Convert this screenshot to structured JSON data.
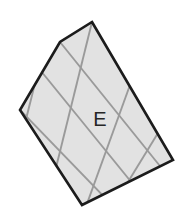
{
  "figure": {
    "name": "shaded-grid-polygon",
    "label": "E",
    "label_position": {
      "x": 100,
      "y": 121
    },
    "colors": {
      "background": "#ffffff",
      "fill": "#e2e2e2",
      "grid_line": "#9a9a9a",
      "outline": "#1c1c1c",
      "label_text": "#262626"
    },
    "outline_width": 2.6,
    "grid_line_width": 1.9,
    "outline_points": "92,22 173,160 82,205 20,110 60,42",
    "vertices": [
      {
        "name": "top",
        "x": 92,
        "y": 22
      },
      {
        "name": "right",
        "x": 173,
        "y": 160
      },
      {
        "name": "bottom",
        "x": 82,
        "y": 205
      },
      {
        "name": "left",
        "x": 20,
        "y": 110
      },
      {
        "name": "upper-left-bend",
        "x": 60,
        "y": 42
      }
    ],
    "grid": {
      "cell_count_visible": 12,
      "lines": [
        {
          "name": "grid-line-a1",
          "x1": 32,
          "y1": 60,
          "x2": 141,
          "y2": 194
        },
        {
          "name": "grid-line-a2",
          "x1": 60,
          "y1": 42,
          "x2": 168,
          "y2": 176
        },
        {
          "name": "grid-line-a3",
          "x1": 20,
          "y1": 110,
          "x2": 113,
          "y2": 206
        },
        {
          "name": "grid-line-b1",
          "x1": 48,
          "y1": 32,
          "x2": 22,
          "y2": 135
        },
        {
          "name": "grid-line-b2",
          "x1": 92,
          "y1": 22,
          "x2": 48,
          "y2": 200
        },
        {
          "name": "grid-line-b3",
          "x1": 130,
          "y1": 85,
          "x2": 84,
          "y2": 212
        },
        {
          "name": "grid-line-b4",
          "x1": 158,
          "y1": 133,
          "x2": 120,
          "y2": 195
        }
      ]
    }
  }
}
